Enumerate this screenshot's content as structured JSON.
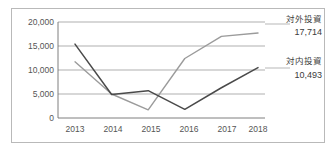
{
  "chart_data": {
    "type": "line",
    "title": "",
    "subtitle": "",
    "xlabel": "",
    "ylabel": "",
    "categories": [
      "2013",
      "2014",
      "2015",
      "2016",
      "2017",
      "2018"
    ],
    "x": [
      2013,
      2014,
      2015,
      2016,
      2017,
      2018
    ],
    "ylim": [
      0,
      20000
    ],
    "yticks": [
      0,
      5000,
      10000,
      15000,
      20000
    ],
    "ytick_labels": [
      "0",
      "5,000",
      "10,000",
      "15,000",
      "20,000"
    ],
    "grid": true,
    "legend_position": "right-inline-annotation",
    "series": [
      {
        "name": "対外投資",
        "color": "#9b9b9b",
        "values": [
          11700,
          5000,
          1700,
          12400,
          17000,
          17714
        ],
        "end_label": "対外投資",
        "end_value_label": "17,714"
      },
      {
        "name": "対内投資",
        "color": "#4a4a4a",
        "values": [
          15400,
          4900,
          5700,
          1800,
          6300,
          10493
        ],
        "end_label": "対内投資",
        "end_value_label": "10,493"
      }
    ]
  },
  "axes": {
    "ytick_labels": [
      "20,000",
      "15,000",
      "10,000",
      "5,000",
      "0"
    ],
    "xtick_labels": [
      "2013",
      "2014",
      "2015",
      "2016",
      "2017",
      "2018"
    ]
  },
  "annotations": {
    "outbound_name": "対外投資",
    "outbound_value": "17,714",
    "inbound_name": "対内投資",
    "inbound_value": "10,493"
  }
}
